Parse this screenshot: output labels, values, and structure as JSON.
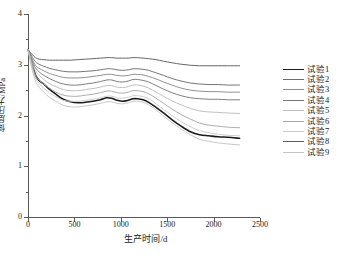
{
  "chart_data": {
    "type": "line",
    "title": "",
    "xlabel": "生产时间/d",
    "ylabel": "储层压力/MPa",
    "xlim": [
      0,
      2500
    ],
    "ylim": [
      0,
      4
    ],
    "xticks": [
      0,
      500,
      1000,
      1500,
      2000,
      2500
    ],
    "yticks": [
      0,
      1,
      2,
      3,
      4
    ],
    "xtick_labels": [
      "0",
      "500",
      "1000",
      "1500",
      "2000",
      "2500"
    ],
    "ytick_labels": [
      "0",
      "1",
      "2",
      "3",
      "4"
    ],
    "minor_y_ticks": [
      0.5,
      1.5,
      2.5,
      3.5
    ],
    "grid": false,
    "legend_position": "right",
    "x": [
      0,
      40,
      80,
      120,
      170,
      230,
      300,
      380,
      460,
      540,
      620,
      700,
      780,
      850,
      900,
      960,
      1020,
      1080,
      1130,
      1180,
      1240,
      1300,
      1380,
      1460,
      1550,
      1650,
      1750,
      1850,
      1950,
      2050,
      2150,
      2280
    ],
    "series": [
      {
        "name": "试验1",
        "color": "#1c1c1c",
        "width": 1.55,
        "values": [
          3.3,
          3.05,
          2.8,
          2.69,
          2.62,
          2.52,
          2.42,
          2.32,
          2.27,
          2.25,
          2.26,
          2.28,
          2.31,
          2.35,
          2.34,
          2.3,
          2.28,
          2.3,
          2.33,
          2.33,
          2.31,
          2.26,
          2.16,
          2.05,
          1.92,
          1.79,
          1.68,
          1.62,
          1.6,
          1.58,
          1.57,
          1.55
        ]
      },
      {
        "name": "试验2",
        "color": "#6e6e6e",
        "width": 0.95,
        "values": [
          3.3,
          3.17,
          3.06,
          3.01,
          2.97,
          2.93,
          2.9,
          2.87,
          2.86,
          2.86,
          2.87,
          2.88,
          2.9,
          2.92,
          2.92,
          2.9,
          2.89,
          2.9,
          2.92,
          2.92,
          2.91,
          2.89,
          2.84,
          2.79,
          2.73,
          2.68,
          2.64,
          2.62,
          2.61,
          2.61,
          2.6,
          2.6
        ]
      },
      {
        "name": "试验3",
        "color": "#8a8a8a",
        "width": 0.95,
        "values": [
          3.3,
          3.13,
          2.99,
          2.93,
          2.88,
          2.83,
          2.79,
          2.75,
          2.74,
          2.74,
          2.75,
          2.77,
          2.79,
          2.81,
          2.81,
          2.79,
          2.78,
          2.79,
          2.81,
          2.81,
          2.8,
          2.77,
          2.72,
          2.66,
          2.6,
          2.54,
          2.5,
          2.48,
          2.47,
          2.47,
          2.46,
          2.46
        ]
      },
      {
        "name": "试验4",
        "color": "#787878",
        "width": 0.95,
        "values": [
          3.3,
          3.1,
          2.94,
          2.86,
          2.79,
          2.73,
          2.67,
          2.62,
          2.6,
          2.6,
          2.62,
          2.64,
          2.67,
          2.7,
          2.7,
          2.67,
          2.66,
          2.68,
          2.71,
          2.71,
          2.69,
          2.66,
          2.59,
          2.52,
          2.45,
          2.39,
          2.35,
          2.33,
          2.32,
          2.32,
          2.31,
          2.31
        ]
      },
      {
        "name": "试验5",
        "color": "#bcbcbc",
        "width": 0.95,
        "values": [
          3.3,
          3.06,
          2.88,
          2.79,
          2.71,
          2.63,
          2.57,
          2.51,
          2.49,
          2.49,
          2.51,
          2.53,
          2.56,
          2.59,
          2.59,
          2.56,
          2.55,
          2.57,
          2.6,
          2.6,
          2.58,
          2.54,
          2.46,
          2.38,
          2.29,
          2.21,
          2.14,
          2.09,
          2.07,
          2.06,
          2.05,
          2.04
        ]
      },
      {
        "name": "试验6",
        "color": "#a8a8a8",
        "width": 0.95,
        "values": [
          3.3,
          3.02,
          2.8,
          2.7,
          2.62,
          2.54,
          2.46,
          2.4,
          2.38,
          2.38,
          2.4,
          2.42,
          2.45,
          2.48,
          2.48,
          2.45,
          2.44,
          2.46,
          2.49,
          2.49,
          2.47,
          2.43,
          2.34,
          2.24,
          2.13,
          2.02,
          1.93,
          1.85,
          1.81,
          1.79,
          1.77,
          1.76
        ]
      },
      {
        "name": "试验7",
        "color": "#cacaca",
        "width": 0.95,
        "values": [
          3.3,
          2.98,
          2.74,
          2.63,
          2.54,
          2.45,
          2.37,
          2.3,
          2.28,
          2.28,
          2.3,
          2.32,
          2.35,
          2.38,
          2.38,
          2.35,
          2.34,
          2.36,
          2.39,
          2.39,
          2.37,
          2.33,
          2.23,
          2.12,
          2.0,
          1.88,
          1.78,
          1.7,
          1.66,
          1.63,
          1.61,
          1.6
        ]
      },
      {
        "name": "试验8",
        "color": "#5e5e5e",
        "width": 0.95,
        "values": [
          3.3,
          3.21,
          3.14,
          3.11,
          3.1,
          3.09,
          3.09,
          3.09,
          3.09,
          3.1,
          3.11,
          3.12,
          3.13,
          3.14,
          3.14,
          3.13,
          3.13,
          3.13,
          3.14,
          3.14,
          3.13,
          3.12,
          3.1,
          3.07,
          3.04,
          3.01,
          2.99,
          2.98,
          2.98,
          2.98,
          2.98,
          2.98
        ]
      },
      {
        "name": "试验9",
        "color": "#c4c4c4",
        "width": 0.95,
        "values": [
          3.3,
          2.94,
          2.68,
          2.56,
          2.46,
          2.36,
          2.28,
          2.2,
          2.17,
          2.17,
          2.19,
          2.21,
          2.24,
          2.27,
          2.27,
          2.24,
          2.23,
          2.25,
          2.28,
          2.28,
          2.26,
          2.21,
          2.11,
          1.99,
          1.86,
          1.73,
          1.62,
          1.53,
          1.49,
          1.46,
          1.44,
          1.42
        ]
      }
    ]
  },
  "legend": {
    "items": [
      {
        "label": "试验1"
      },
      {
        "label": "试验2"
      },
      {
        "label": "试验3"
      },
      {
        "label": "试验4"
      },
      {
        "label": "试验5"
      },
      {
        "label": "试验6"
      },
      {
        "label": "试验7"
      },
      {
        "label": "试验8"
      },
      {
        "label": "试验9"
      }
    ]
  },
  "axes": {
    "y_title": "储层压力/MPa",
    "x_title": "生产时间/d"
  }
}
